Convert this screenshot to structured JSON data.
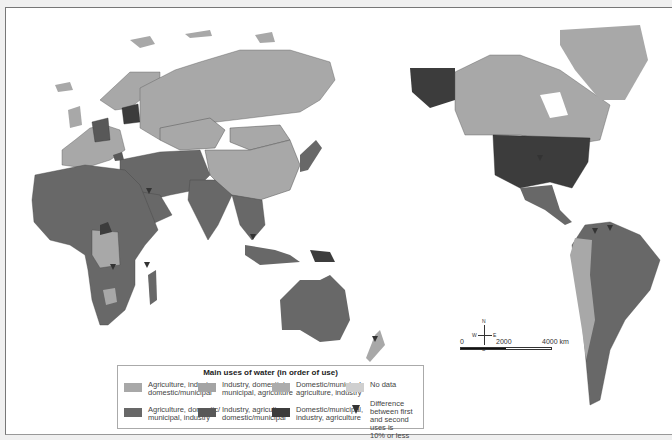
{
  "legend": {
    "title": "Main uses of water (in order of use)",
    "items": [
      {
        "label_line1": "Agriculture, industry,",
        "label_line2": "domestic/municipal",
        "color": "#a8a8a8"
      },
      {
        "label_line1": "Industry, domestic/",
        "label_line2": "municipal, agriculture",
        "color": "#a4a4a4"
      },
      {
        "label_line1": "Domestic/municipal,",
        "label_line2": "agriculture, industry",
        "color": "#acacac"
      },
      {
        "label_line1": "No data",
        "label_line2": "",
        "color": "#cfcfcf"
      },
      {
        "label_line1": "Agriculture, domestic/",
        "label_line2": "municipal, industry",
        "color": "#686868"
      },
      {
        "label_line1": "Industry, agriculture,",
        "label_line2": "domestic/municipal",
        "color": "#585858"
      },
      {
        "label_line1": "Domestic/municipal,",
        "label_line2": "industry, agriculture",
        "color": "#3c3c3c"
      },
      {
        "label_line1": "Difference between first",
        "label_line2": "and second uses is",
        "label_line3": "10% or less",
        "symbol": "triangle-down"
      }
    ]
  },
  "compass": {
    "n": "N",
    "s": "S",
    "e": "E",
    "w": "W"
  },
  "scale": {
    "t0": "0",
    "t1": "2000",
    "t2": "4000 km"
  }
}
